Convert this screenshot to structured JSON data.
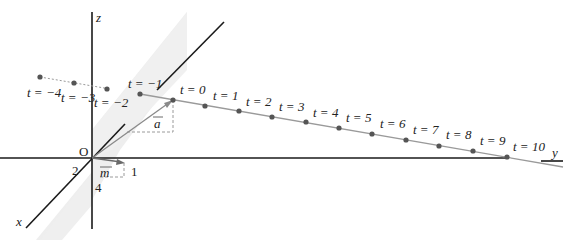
{
  "diagram": {
    "axes": {
      "x_label": "x",
      "y_label": "y",
      "z_label": "z",
      "origin_label": "O"
    },
    "vectors": {
      "a_label": "a",
      "m_label": "m",
      "m_components": {
        "x": "2",
        "y": "1",
        "z": "4"
      }
    },
    "points": [
      {
        "t": -4,
        "label": "t = −4"
      },
      {
        "t": -3,
        "label": "t = −3"
      },
      {
        "t": -2,
        "label": "t = −2"
      },
      {
        "t": -1,
        "label": "t = −1"
      },
      {
        "t": 0,
        "label": "t = 0"
      },
      {
        "t": 1,
        "label": "t = 1"
      },
      {
        "t": 2,
        "label": "t = 2"
      },
      {
        "t": 3,
        "label": "t = 3"
      },
      {
        "t": 4,
        "label": "t = 4"
      },
      {
        "t": 5,
        "label": "t = 5"
      },
      {
        "t": 6,
        "label": "t = 6"
      },
      {
        "t": 7,
        "label": "t = 7"
      },
      {
        "t": 8,
        "label": "t = 8"
      },
      {
        "t": 9,
        "label": "t = 9"
      },
      {
        "t": 10,
        "label": "t = 10"
      }
    ],
    "colors": {
      "axis": "#1a1a1a",
      "line": "#9a9a9a",
      "point": "#555555",
      "plane": "#ececec",
      "dashed": "#9a9a9a"
    }
  }
}
